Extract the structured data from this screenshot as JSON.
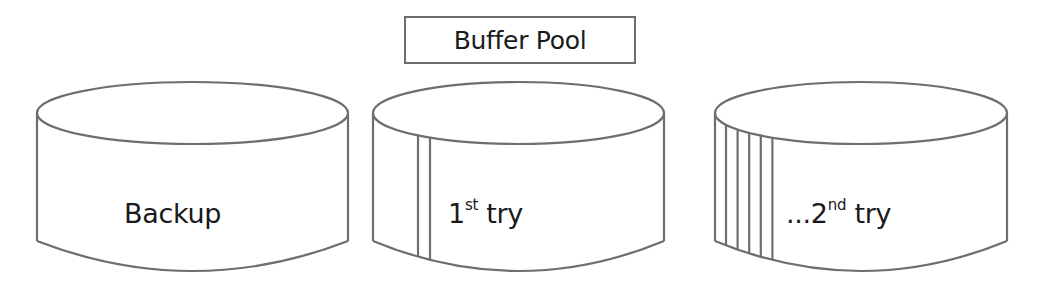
{
  "buffer_pool": {
    "label": "Buffer Pool"
  },
  "cylinders": [
    {
      "name": "backup",
      "label": "Backup",
      "stripes": 0
    },
    {
      "name": "first-try",
      "label_prefix": "1",
      "label_sup": "st",
      "label_suffix": " try",
      "stripes": 2
    },
    {
      "name": "second-try",
      "label_prefix": "...2",
      "label_sup": "nd",
      "label_suffix": " try",
      "stripes": 5
    }
  ],
  "colors": {
    "stroke": "#6e6e6e",
    "text": "#1a1a1a",
    "background": "#ffffff"
  }
}
